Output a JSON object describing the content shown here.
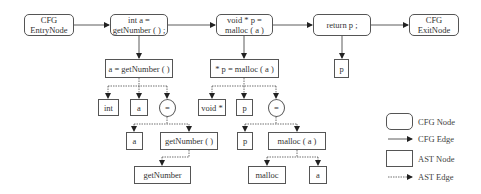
{
  "cfg_nodes": {
    "entry": "CFG\nEntryNode",
    "stmt1": "int a =\ngetNumber ( ) ;",
    "stmt2": "void * p =\nmalloc ( a )",
    "stmt3": "return p ;",
    "exit": "CFG\nExitNode"
  },
  "ast_nodes": {
    "s1_root": "a = getNumber ( )",
    "s1_int": "int",
    "s1_a": "a",
    "s1_eq": "=",
    "s1_eq_a": "a",
    "s1_call": "getNumber ( )",
    "s1_callee": "getNumber",
    "s2_root": "* p = malloc ( a )",
    "s2_type": "void *",
    "s2_p": "p",
    "s2_eq": "=",
    "s2_eq_p": "p",
    "s2_call": "malloc ( a )",
    "s2_callee": "malloc",
    "s2_arg": "a",
    "s3_p": "p"
  },
  "legend": {
    "cfg_node": "CFG Node",
    "cfg_edge": "CFG Edge",
    "ast_node": "AST Node",
    "ast_edge": "AST Edge"
  },
  "colors": {
    "line": "#333333",
    "border": "#555555"
  }
}
